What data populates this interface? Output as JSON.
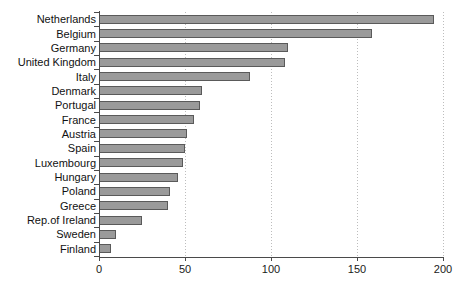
{
  "chart_data": {
    "type": "bar",
    "orientation": "horizontal",
    "title": "",
    "subtitle": "",
    "xlabel": "",
    "ylabel": "",
    "xlim": [
      0,
      200
    ],
    "xticks": [
      "0",
      "50",
      "100",
      "150",
      "200"
    ],
    "xtick_values": [
      0,
      50,
      100,
      150,
      200
    ],
    "grid": "vertical-dotted-at-xticks",
    "legend": "none",
    "bar_color": "#9a9a9a",
    "bar_border_color": "#5a5a5a",
    "axis_color": "#4a4a4a",
    "gridline_color": "#bdbdbd",
    "categories": [
      "Netherlands",
      "Belgium",
      "Germany",
      "United Kingdom",
      "Italy",
      "Denmark",
      "Portugal",
      "France",
      "Austria",
      "Spain",
      "Luxembourg",
      "Hungary",
      "Poland",
      "Greece",
      "Rep.of Ireland",
      "Sweden",
      "Finland"
    ],
    "values": [
      195,
      159,
      110,
      108,
      88,
      60,
      59,
      55,
      51,
      50,
      49,
      46,
      41,
      40,
      25,
      10,
      7
    ]
  }
}
